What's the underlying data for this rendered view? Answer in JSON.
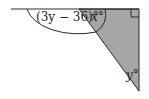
{
  "diagram": {
    "type": "geometry-figure",
    "shape": "right triangle on a straight line",
    "colors": {
      "fill": "#a6a6a6",
      "stroke": "#2a2a2a",
      "background": "#ffffff"
    },
    "labels": {
      "exterior_angle": "(3y − 36)°",
      "top_angle": "x°",
      "bottom_angle": "y°"
    },
    "right_angle_marker": true
  }
}
